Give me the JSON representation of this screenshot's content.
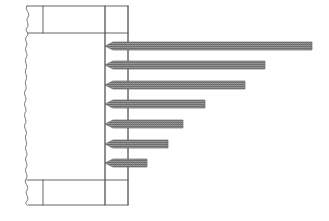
{
  "figure": {
    "canvas": {
      "width": 329,
      "height": 221
    },
    "background_color": "#ffffff",
    "line_color": "#555555",
    "bar_fill_color": "#8c8c8c",
    "bar_hatch_color": "#5f5f5f",
    "bar_outline_color": "#6a6a6a"
  },
  "structure": {
    "break_line": {
      "name": "wavy-break-line",
      "x": 26,
      "y_top": 6,
      "y_bottom": 205,
      "amplitude": 4
    },
    "body_outline": {
      "left": 26,
      "right": 128,
      "top": 6,
      "bottom": 205
    },
    "top_band": {
      "y_top": 6,
      "y_bottom": 33,
      "divider_x": 43
    },
    "bottom_band": {
      "y_top": 180,
      "y_bottom": 205,
      "divider_x": 43
    },
    "vertical_rules": [
      {
        "name": "inner-vertical-rule",
        "x": 105
      },
      {
        "name": "outer-vertical-rule",
        "x": 128
      }
    ]
  },
  "chart_data": {
    "type": "bar",
    "orientation": "horizontal",
    "title": "",
    "subtitle": "",
    "xlabel": "",
    "ylabel": "",
    "grid": false,
    "legend": null,
    "baseline_x": 105,
    "bar_height": 8,
    "bar_pitch": 19.5,
    "categories": [
      "1",
      "2",
      "3",
      "4",
      "5",
      "6",
      "7"
    ],
    "values": [
      207,
      160,
      140,
      100,
      78,
      63,
      42
    ],
    "xlim": [
      0,
      210
    ],
    "bars": [
      {
        "index": 1,
        "y": 42,
        "x_start": 105,
        "x_end": 312,
        "length": 207
      },
      {
        "index": 2,
        "y": 61,
        "x_start": 105,
        "x_end": 265,
        "length": 160
      },
      {
        "index": 3,
        "y": 81,
        "x_start": 105,
        "x_end": 245,
        "length": 140
      },
      {
        "index": 4,
        "y": 100,
        "x_start": 105,
        "x_end": 205,
        "length": 100
      },
      {
        "index": 5,
        "y": 120,
        "x_start": 105,
        "x_end": 183,
        "length": 78
      },
      {
        "index": 6,
        "y": 140,
        "x_start": 105,
        "x_end": 168,
        "length": 63
      },
      {
        "index": 7,
        "y": 159,
        "x_start": 105,
        "x_end": 147,
        "length": 42
      }
    ]
  }
}
